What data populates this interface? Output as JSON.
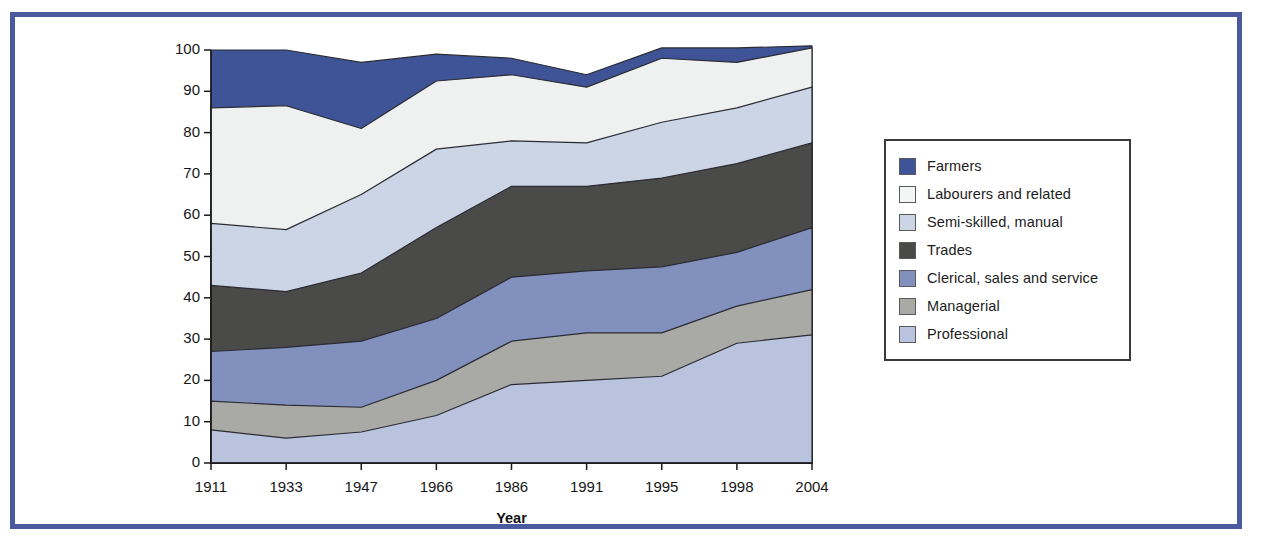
{
  "figure": {
    "frame_color": "#4a5a9e",
    "background": "#ffffff"
  },
  "chart_data": {
    "type": "area",
    "stacked": true,
    "normalized_percent": true,
    "title": "",
    "subtitle": "",
    "xlabel": "Year",
    "ylabel": "",
    "categories": [
      "1911",
      "1933",
      "1947",
      "1966",
      "1986",
      "1991",
      "1995",
      "1998",
      "2004"
    ],
    "x": [
      1911,
      1933,
      1947,
      1966,
      1986,
      1991,
      1995,
      1998,
      2004
    ],
    "xlim": [
      1911,
      2004
    ],
    "ylim": [
      0,
      100
    ],
    "yticks": [
      0,
      10,
      20,
      30,
      40,
      50,
      60,
      70,
      80,
      90,
      100
    ],
    "ytick_labels": [
      "0",
      "10",
      "20",
      "30",
      "40",
      "50",
      "60",
      "70",
      "80",
      "90",
      "100"
    ],
    "grid": false,
    "legend_position": "right",
    "stack_order_bottom_to_top": [
      "Professional",
      "Managerial",
      "Clerical, sales and service",
      "Trades",
      "Semi-skilled, manual",
      "Labourers and related",
      "Farmers"
    ],
    "series": [
      {
        "name": "Professional",
        "color": "#b9c3dd",
        "values": [
          8,
          6,
          7.5,
          11.5,
          19,
          20,
          21,
          29,
          31
        ],
        "cumulative_top": [
          8,
          6,
          7.5,
          11.5,
          19,
          20,
          21,
          29,
          31
        ]
      },
      {
        "name": "Managerial",
        "color": "#a9a9a5",
        "values": [
          7,
          8,
          6,
          8.5,
          10.5,
          11.5,
          10.5,
          9,
          11
        ],
        "cumulative_top": [
          15,
          14,
          13.5,
          20,
          29.5,
          31.5,
          31.5,
          38,
          42
        ]
      },
      {
        "name": "Clerical, sales and service",
        "color": "#8190bd",
        "values": [
          12,
          14,
          16,
          15,
          15.5,
          15,
          16,
          13,
          15
        ],
        "cumulative_top": [
          27,
          28,
          29.5,
          35,
          45,
          46.5,
          47.5,
          51,
          57
        ]
      },
      {
        "name": "Trades",
        "color": "#4a4a48",
        "values": [
          16,
          13.5,
          16.5,
          22,
          22,
          20.5,
          21.5,
          21.5,
          20.5
        ],
        "cumulative_top": [
          43,
          41.5,
          46,
          57,
          67,
          67,
          69,
          72.5,
          77.5
        ]
      },
      {
        "name": "Semi-skilled, manual",
        "color": "#ccd5e6",
        "values": [
          15,
          15,
          19,
          19,
          11,
          10.5,
          13.5,
          13.5,
          13.5
        ],
        "cumulative_top": [
          58,
          56.5,
          65,
          76,
          78,
          77.5,
          82.5,
          86,
          91
        ]
      },
      {
        "name": "Labourers and related",
        "color": "#eff0f0",
        "values": [
          28,
          30,
          16,
          16.5,
          16,
          13.5,
          15.5,
          11,
          9.5
        ],
        "cumulative_top": [
          86,
          86.5,
          81,
          92.5,
          94,
          91,
          98,
          97,
          100.5
        ]
      },
      {
        "name": "Farmers",
        "color": "#3e5496",
        "values": [
          14,
          13.5,
          16,
          6.5,
          4,
          3,
          2.5,
          3.5,
          0.5
        ],
        "cumulative_top": [
          100,
          100,
          97,
          99,
          98,
          94,
          100.5,
          100.5,
          101
        ]
      }
    ]
  },
  "legend": {
    "items": [
      {
        "label": "Farmers",
        "color": "#3e5496"
      },
      {
        "label": "Labourers and related",
        "color": "#f4f5f5"
      },
      {
        "label": "Semi-skilled, manual",
        "color": "#ccd5e6"
      },
      {
        "label": "Trades",
        "color": "#4a4a48"
      },
      {
        "label": "Clerical, sales and service",
        "color": "#8190bd"
      },
      {
        "label": "Managerial",
        "color": "#a9a9a5"
      },
      {
        "label": "Professional",
        "color": "#b9c3dd"
      }
    ]
  }
}
